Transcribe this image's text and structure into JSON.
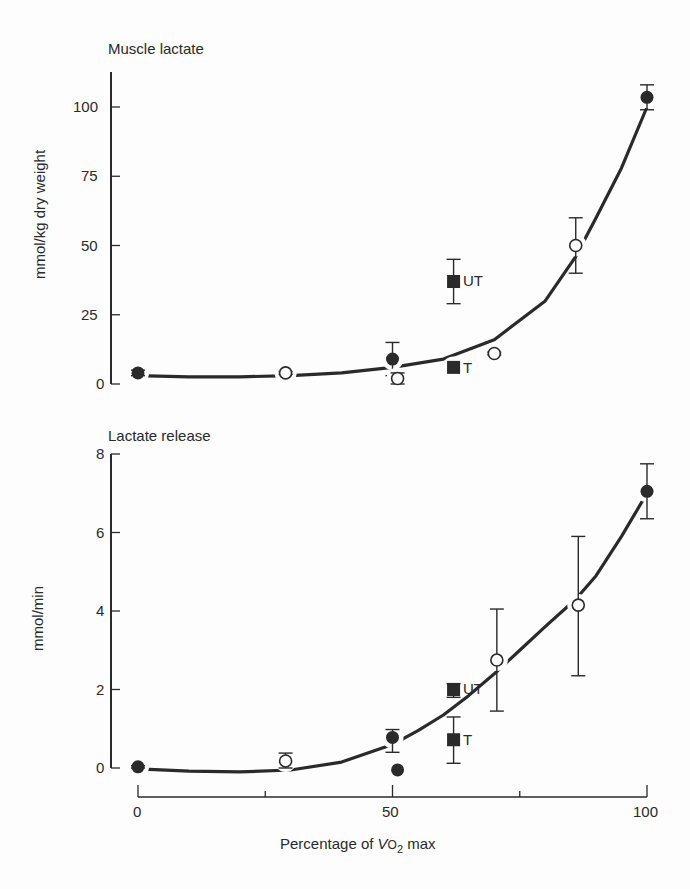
{
  "chart_data": [
    {
      "type": "scatter",
      "title": "Muscle lactate",
      "xlabel": "Percentage of Vo2 max",
      "ylabel": "mmol/kg dry weight",
      "xlim": [
        0,
        100
      ],
      "ylim": [
        0,
        110
      ],
      "xticks": [
        0,
        50,
        100
      ],
      "yticks": [
        0,
        25,
        50,
        75,
        100
      ],
      "grid": false,
      "legend": "none (inline point labels UT, T)",
      "series": [
        {
          "name": "filled circles",
          "marker": "filled-circle",
          "points": [
            {
              "x": 0,
              "y": 4,
              "err_low": 3,
              "err_high": 5
            },
            {
              "x": 50,
              "y": 9,
              "err_low": 3,
              "err_high": 15
            },
            {
              "x": 100,
              "y": 103.5,
              "err_low": 99,
              "err_high": 108
            }
          ]
        },
        {
          "name": "open circles",
          "marker": "open-circle",
          "points": [
            {
              "x": 29,
              "y": 4,
              "err_low": 3.5,
              "err_high": 4.5
            },
            {
              "x": 51,
              "y": 2,
              "err_low": 0,
              "err_high": 4
            },
            {
              "x": 70,
              "y": 11,
              "err_low": 10.5,
              "err_high": 11.5
            },
            {
              "x": 86,
              "y": 50,
              "err_low": 40,
              "err_high": 60
            }
          ]
        },
        {
          "name": "UT",
          "marker": "filled-square",
          "points": [
            {
              "x": 62,
              "y": 37,
              "err_low": 29,
              "err_high": 45
            }
          ]
        },
        {
          "name": "T",
          "marker": "filled-square",
          "points": [
            {
              "x": 62,
              "y": 6,
              "err_low": 6,
              "err_high": 6
            }
          ]
        }
      ],
      "fit_curve": {
        "type": "exponential",
        "x": [
          0,
          10,
          20,
          30,
          40,
          50,
          60,
          70,
          80,
          86,
          90,
          95,
          100
        ],
        "y": [
          3,
          2.6,
          2.6,
          3,
          4,
          6,
          9,
          16,
          30,
          46,
          60,
          78,
          100
        ]
      }
    },
    {
      "type": "scatter",
      "title": "Lactate release",
      "xlabel": "Percentage of Vo2 max",
      "ylabel": "mmol/min",
      "xlim": [
        0,
        100
      ],
      "ylim": [
        0,
        8
      ],
      "xticks": [
        0,
        25,
        50,
        75,
        100
      ],
      "xtick_labels": [
        "0",
        "",
        "50",
        "",
        "100"
      ],
      "yticks": [
        0,
        2,
        4,
        6,
        8
      ],
      "grid": false,
      "legend": "none (inline point labels UT, T)",
      "series": [
        {
          "name": "filled circles",
          "marker": "filled-circle",
          "points": [
            {
              "x": 0,
              "y": 0.03,
              "err_low": 0,
              "err_high": 0.06
            },
            {
              "x": 50,
              "y": 0.78,
              "err_low": 0.4,
              "err_high": 0.98
            },
            {
              "x": 51,
              "y": -0.05,
              "err_low": -0.05,
              "err_high": -0.05
            },
            {
              "x": 100,
              "y": 7.05,
              "err_low": 6.35,
              "err_high": 7.75
            }
          ]
        },
        {
          "name": "open circles",
          "marker": "open-circle",
          "points": [
            {
              "x": 29,
              "y": 0.18,
              "err_low": 0.0,
              "err_high": 0.38
            },
            {
              "x": 70.5,
              "y": 2.75,
              "err_low": 1.45,
              "err_high": 4.05
            },
            {
              "x": 86.5,
              "y": 4.15,
              "err_low": 2.35,
              "err_high": 5.9
            }
          ]
        },
        {
          "name": "UT",
          "marker": "filled-square",
          "points": [
            {
              "x": 62,
              "y": 2.0,
              "err_low": 1.8,
              "err_high": 2.15
            }
          ]
        },
        {
          "name": "T",
          "marker": "filled-square",
          "points": [
            {
              "x": 62,
              "y": 0.72,
              "err_low": 0.12,
              "err_high": 1.3
            }
          ]
        }
      ],
      "fit_curve": {
        "type": "exponential",
        "x": [
          0,
          10,
          20,
          30,
          40,
          50,
          55,
          60,
          65,
          70,
          75,
          80,
          86,
          90,
          95,
          100
        ],
        "y": [
          -0.02,
          -0.08,
          -0.1,
          -0.05,
          0.15,
          0.6,
          0.95,
          1.35,
          1.85,
          2.4,
          3.0,
          3.6,
          4.3,
          4.9,
          5.9,
          7.0
        ]
      }
    }
  ],
  "labels": {
    "top_title": "Muscle lactate",
    "top_ylabel": "mmol/kg dry weight",
    "top_yticks": [
      "100",
      "75",
      "50",
      "25",
      "0"
    ],
    "top_ut": "UT",
    "top_t": "T",
    "bottom_title": "Lactate release",
    "bottom_ylabel": "mmol/min",
    "bottom_yticks": [
      "8",
      "6",
      "4",
      "2",
      "0"
    ],
    "bottom_ut": "UT",
    "bottom_t": "T",
    "xticks": [
      "0",
      "50",
      "100"
    ],
    "xlabel_prefix": "Percentage of ",
    "xlabel_v": "V",
    "xlabel_o": "O",
    "xlabel_sub": "2",
    "xlabel_suffix": " max"
  },
  "colors": {
    "ink": "#2a2a2a",
    "background": "#fdfdfd"
  }
}
